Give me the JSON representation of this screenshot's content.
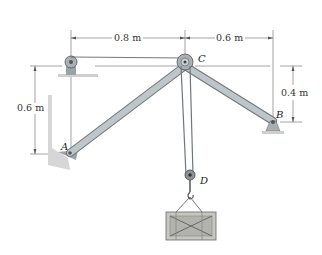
{
  "diagram": {
    "type": "statics-pulley-frame",
    "points": {
      "A": "A",
      "B": "B",
      "C": "C",
      "D": "D"
    },
    "dimensions": {
      "horizontal_left": "0.8 m",
      "horizontal_right": "0.6 m",
      "vertical_left": "0.6 m",
      "vertical_right": "0.4 m"
    },
    "colors": {
      "member": "#b9c0c4",
      "member_edge": "#6f777c",
      "dimension_line": "#555555",
      "ground": "#c9c9c9",
      "crate": "#c7c7c2"
    }
  }
}
